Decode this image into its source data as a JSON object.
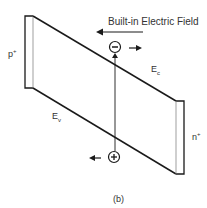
{
  "diagram": {
    "title": "Built-in Electric Field",
    "caption": "(b)",
    "labels": {
      "p_region": {
        "base": "p",
        "sup": "+"
      },
      "n_region": {
        "base": "n",
        "sup": "+"
      },
      "conduction_band": {
        "base": "E",
        "sub": "c"
      },
      "valence_band": {
        "base": "E",
        "sub": "v"
      }
    },
    "carriers": {
      "electron": {
        "symbol": "−",
        "direction": "right"
      },
      "hole": {
        "symbol": "+",
        "direction": "left"
      }
    },
    "field_arrow_direction": "left",
    "colors": {
      "line": "#1a1a1a",
      "text": "#333333",
      "background": "#ffffff"
    }
  }
}
